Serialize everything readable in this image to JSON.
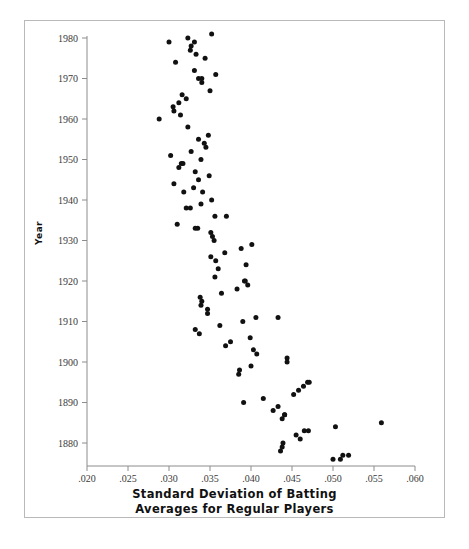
{
  "figure": {
    "ylabel": "Year",
    "xtitle_line1": "Standard Deviation of Batting",
    "xtitle_line2": "Averages for Regular Players"
  },
  "chart_data": {
    "type": "scatter",
    "title": "",
    "xlabel": "Standard Deviation of Batting Averages for Regular Players",
    "ylabel": "Year",
    "xlim": [
      0.02,
      0.06
    ],
    "ylim": [
      1874,
      1981
    ],
    "grid": false,
    "legend": null,
    "marker": {
      "shape": "circle",
      "color": "#111111",
      "size": 4.6
    },
    "xticks": [
      0.02,
      0.025,
      0.03,
      0.035,
      0.04,
      0.045,
      0.05,
      0.055,
      0.06
    ],
    "xticklabels": [
      ".020",
      ".025",
      ".030",
      ".035",
      ".040",
      ".045",
      ".050",
      ".055",
      ".060"
    ],
    "yticks": [
      1880,
      1890,
      1900,
      1910,
      1920,
      1930,
      1940,
      1950,
      1960,
      1970,
      1980
    ],
    "yticklabels": [
      "1880",
      "1890",
      "1900",
      "1910",
      "1920",
      "1930",
      "1940",
      "1950",
      "1960",
      "1970",
      "1980"
    ],
    "series": [
      {
        "name": "Standard deviation of batting averages by season",
        "points": [
          {
            "x": 0.05,
            "y": 1876
          },
          {
            "x": 0.0509,
            "y": 1876
          },
          {
            "x": 0.0512,
            "y": 1877
          },
          {
            "x": 0.0519,
            "y": 1877
          },
          {
            "x": 0.0436,
            "y": 1878
          },
          {
            "x": 0.0438,
            "y": 1879
          },
          {
            "x": 0.0439,
            "y": 1880
          },
          {
            "x": 0.046,
            "y": 1881
          },
          {
            "x": 0.0455,
            "y": 1882
          },
          {
            "x": 0.0465,
            "y": 1883
          },
          {
            "x": 0.047,
            "y": 1883
          },
          {
            "x": 0.0503,
            "y": 1884
          },
          {
            "x": 0.0559,
            "y": 1885
          },
          {
            "x": 0.0438,
            "y": 1886
          },
          {
            "x": 0.0441,
            "y": 1887
          },
          {
            "x": 0.0441,
            "y": 1887
          },
          {
            "x": 0.0427,
            "y": 1888
          },
          {
            "x": 0.0433,
            "y": 1889
          },
          {
            "x": 0.0391,
            "y": 1890
          },
          {
            "x": 0.0415,
            "y": 1891
          },
          {
            "x": 0.0452,
            "y": 1892
          },
          {
            "x": 0.0458,
            "y": 1893
          },
          {
            "x": 0.0464,
            "y": 1894
          },
          {
            "x": 0.0469,
            "y": 1895
          },
          {
            "x": 0.0471,
            "y": 1895
          },
          {
            "x": 0.0385,
            "y": 1897
          },
          {
            "x": 0.0386,
            "y": 1898
          },
          {
            "x": 0.04,
            "y": 1899
          },
          {
            "x": 0.0444,
            "y": 1900
          },
          {
            "x": 0.0444,
            "y": 1901
          },
          {
            "x": 0.0407,
            "y": 1902
          },
          {
            "x": 0.0403,
            "y": 1903
          },
          {
            "x": 0.0369,
            "y": 1904
          },
          {
            "x": 0.0375,
            "y": 1905
          },
          {
            "x": 0.0399,
            "y": 1906
          },
          {
            "x": 0.0337,
            "y": 1907
          },
          {
            "x": 0.0332,
            "y": 1908
          },
          {
            "x": 0.0362,
            "y": 1909
          },
          {
            "x": 0.039,
            "y": 1910
          },
          {
            "x": 0.0433,
            "y": 1911
          },
          {
            "x": 0.0406,
            "y": 1911
          },
          {
            "x": 0.0347,
            "y": 1912
          },
          {
            "x": 0.0347,
            "y": 1913
          },
          {
            "x": 0.0339,
            "y": 1914
          },
          {
            "x": 0.034,
            "y": 1915
          },
          {
            "x": 0.0338,
            "y": 1916
          },
          {
            "x": 0.0364,
            "y": 1917
          },
          {
            "x": 0.0383,
            "y": 1918
          },
          {
            "x": 0.0396,
            "y": 1919
          },
          {
            "x": 0.0392,
            "y": 1920
          },
          {
            "x": 0.0393,
            "y": 1920
          },
          {
            "x": 0.0356,
            "y": 1921
          },
          {
            "x": 0.036,
            "y": 1923
          },
          {
            "x": 0.0394,
            "y": 1924
          },
          {
            "x": 0.0357,
            "y": 1925
          },
          {
            "x": 0.0351,
            "y": 1926
          },
          {
            "x": 0.0368,
            "y": 1927
          },
          {
            "x": 0.0388,
            "y": 1928
          },
          {
            "x": 0.0401,
            "y": 1929
          },
          {
            "x": 0.0355,
            "y": 1930
          },
          {
            "x": 0.0353,
            "y": 1931
          },
          {
            "x": 0.0351,
            "y": 1932
          },
          {
            "x": 0.0335,
            "y": 1933
          },
          {
            "x": 0.0332,
            "y": 1933
          },
          {
            "x": 0.031,
            "y": 1934
          },
          {
            "x": 0.0356,
            "y": 1936
          },
          {
            "x": 0.037,
            "y": 1936
          },
          {
            "x": 0.0326,
            "y": 1938
          },
          {
            "x": 0.0321,
            "y": 1938
          },
          {
            "x": 0.0339,
            "y": 1939
          },
          {
            "x": 0.0352,
            "y": 1940
          },
          {
            "x": 0.0318,
            "y": 1942
          },
          {
            "x": 0.0341,
            "y": 1942
          },
          {
            "x": 0.033,
            "y": 1943
          },
          {
            "x": 0.0306,
            "y": 1944
          },
          {
            "x": 0.0336,
            "y": 1945
          },
          {
            "x": 0.0349,
            "y": 1946
          },
          {
            "x": 0.0332,
            "y": 1947
          },
          {
            "x": 0.0312,
            "y": 1948
          },
          {
            "x": 0.0315,
            "y": 1949
          },
          {
            "x": 0.0317,
            "y": 1949
          },
          {
            "x": 0.0339,
            "y": 1950
          },
          {
            "x": 0.0302,
            "y": 1951
          },
          {
            "x": 0.0327,
            "y": 1952
          },
          {
            "x": 0.0345,
            "y": 1953
          },
          {
            "x": 0.0343,
            "y": 1954
          },
          {
            "x": 0.0336,
            "y": 1955
          },
          {
            "x": 0.0348,
            "y": 1956
          },
          {
            "x": 0.0323,
            "y": 1958
          },
          {
            "x": 0.0288,
            "y": 1960
          },
          {
            "x": 0.0314,
            "y": 1961
          },
          {
            "x": 0.0306,
            "y": 1962
          },
          {
            "x": 0.0305,
            "y": 1963
          },
          {
            "x": 0.0312,
            "y": 1964
          },
          {
            "x": 0.0321,
            "y": 1965
          },
          {
            "x": 0.0316,
            "y": 1966
          },
          {
            "x": 0.035,
            "y": 1967
          },
          {
            "x": 0.034,
            "y": 1969
          },
          {
            "x": 0.0336,
            "y": 1970
          },
          {
            "x": 0.034,
            "y": 1970
          },
          {
            "x": 0.0357,
            "y": 1971
          },
          {
            "x": 0.0331,
            "y": 1972
          },
          {
            "x": 0.0308,
            "y": 1974
          },
          {
            "x": 0.0344,
            "y": 1975
          },
          {
            "x": 0.0333,
            "y": 1976
          },
          {
            "x": 0.0326,
            "y": 1977
          },
          {
            "x": 0.0327,
            "y": 1978
          },
          {
            "x": 0.03,
            "y": 1979
          },
          {
            "x": 0.0331,
            "y": 1979
          },
          {
            "x": 0.0323,
            "y": 1980
          },
          {
            "x": 0.0352,
            "y": 1981
          }
        ]
      }
    ]
  }
}
